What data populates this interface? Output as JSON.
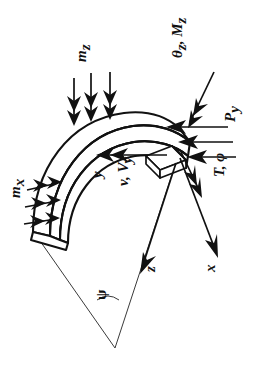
{
  "figure": {
    "name": "curved-cantilever-beam-loading-diagram",
    "orientation_deg": 90,
    "background_color": "#ffffff",
    "line_color": "#111111",
    "thin_line_color": "#3a3a3a"
  },
  "labels": {
    "distributed_moment_z": "m",
    "distributed_moment_z_sub": "z",
    "distributed_moment_x": "m",
    "distributed_moment_x_sub": "x",
    "end_rotation_moment": "θ",
    "end_rotation_moment_sub1": "z",
    "end_rotation_moment_mid": ", M",
    "end_rotation_moment_sub2": "z",
    "transverse_force": "P",
    "transverse_force_sub": "y",
    "torsion_twist": "T, φ",
    "axis_y": "y",
    "displacement_shear": "v, V",
    "displacement_shear_sub": "y",
    "axis_z": "z",
    "axis_x": "x",
    "angle_psi": "ψ"
  },
  "elements": {
    "beam": "curved-beam-body",
    "fixed_end": "fixed-support-end",
    "free_end": "free-end-cross-section",
    "radial_line_a": "radial-line-left",
    "radial_line_b": "radial-line-right",
    "arc_center": "center-of-curvature"
  },
  "load_arrows": {
    "m_z_count": 3,
    "m_z_direction": "downward-double-headed",
    "m_x_count": 3,
    "m_x_direction": "rightward-double-headed",
    "P_y_count": 3,
    "P_y_direction": "leftward-single-headed",
    "theta_z_Mz_direction": "down-left-double-headed",
    "T_phi_direction": "down-right-double-headed",
    "y_axis_direction": "leftward-double-headed",
    "z_axis_direction": "down-left-single-headed",
    "x_axis_direction": "down-right-single-headed"
  }
}
